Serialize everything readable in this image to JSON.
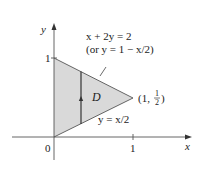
{
  "figure": {
    "type": "region-diagram",
    "axes": {
      "x_label": "x",
      "y_label": "y",
      "origin_label": "0",
      "x_tick_label": "1",
      "y_tick_label": "1"
    },
    "region": {
      "label": "D",
      "fill_color": "#d9d9d9",
      "vertices": [
        [
          0,
          0
        ],
        [
          0,
          1
        ],
        [
          1,
          0.5
        ]
      ]
    },
    "curves": {
      "upper": {
        "equation": "x + 2y = 2",
        "alt_equation": "(or y = 1 − x/2)"
      },
      "lower": {
        "equation": "y = x/2"
      }
    },
    "vertex_label": {
      "text_open": "(1,",
      "num": "1",
      "den": "2",
      "text_close": ")"
    },
    "vertical_strip": {
      "x_value": 0.35,
      "direction": "upward-arrow"
    }
  }
}
